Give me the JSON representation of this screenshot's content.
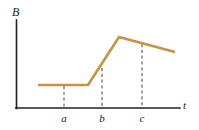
{
  "figure": {
    "background_color": "#ffffff",
    "axis_color": "#231f20",
    "curve_color": "#c9923f",
    "dash_color": "#58595b",
    "y_axis_label": "B",
    "x_axis_label": "t"
  },
  "ticks": [
    {
      "name": "a",
      "label": "a",
      "x": 64
    },
    {
      "name": "b",
      "label": "b",
      "x": 102
    },
    {
      "name": "c",
      "label": "c",
      "x": 142
    }
  ],
  "chart_data": {
    "type": "line",
    "title": "",
    "xlabel": "t",
    "ylabel": "B",
    "grid": false,
    "legend": null,
    "xlim": [
      0,
      199
    ],
    "ylim": [
      0,
      130
    ],
    "axes_px": {
      "y_axis_x": 16,
      "y_axis_top_y": 20,
      "x_axis_y": 108,
      "x_axis_right_x": 180
    },
    "series": [
      {
        "name": "B(t)",
        "color": "#c9923f",
        "points_px": [
          {
            "x": 38,
            "y": 85
          },
          {
            "x": 88,
            "y": 85
          },
          {
            "x": 119,
            "y": 37
          },
          {
            "x": 175,
            "y": 52
          }
        ],
        "segments": [
          {
            "name": "constant",
            "from": "t<a",
            "to": "before rise",
            "description": "flat constant B"
          },
          {
            "name": "increase",
            "from": "before b",
            "to": "peak",
            "description": "linear increase"
          },
          {
            "name": "decrease",
            "from": "peak",
            "to": "end",
            "description": "slow linear decrease"
          }
        ]
      }
    ],
    "dashed_guides": [
      {
        "label": "a",
        "x": 64,
        "y_top": 86,
        "y_bottom": 108
      },
      {
        "label": "b",
        "x": 102,
        "y_top": 68,
        "y_bottom": 108
      },
      {
        "label": "c",
        "x": 142,
        "y_top": 44,
        "y_bottom": 108
      }
    ]
  }
}
